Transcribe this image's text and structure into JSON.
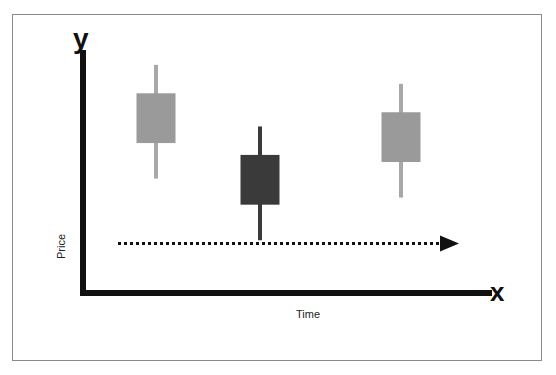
{
  "chart_data": {
    "type": "candlestick",
    "title": "",
    "xlabel": "Time",
    "ylabel": "Price",
    "x_axis_letter": "x",
    "y_axis_letter": "y",
    "ylim": [
      0,
      100
    ],
    "grid": false,
    "legend": "none",
    "categories": [
      "1",
      "2",
      "3"
    ],
    "candles": [
      {
        "name": "candle-1",
        "open": 62,
        "high": 95,
        "low": 47,
        "close": 83,
        "color": "#9a9a9a",
        "wick_color": "#a8a8a8"
      },
      {
        "name": "candle-2",
        "open": 36,
        "high": 69,
        "low": 21,
        "close": 57,
        "color": "#3a3a3a",
        "wick_color": "#3a3a3a"
      },
      {
        "name": "candle-3",
        "open": 54,
        "high": 87,
        "low": 39,
        "close": 75,
        "color": "#9a9a9a",
        "wick_color": "#a8a8a8"
      }
    ],
    "annotations": [
      {
        "type": "dotted-arrow",
        "direction": "right",
        "level": 20,
        "meaning": "time progression"
      }
    ]
  }
}
